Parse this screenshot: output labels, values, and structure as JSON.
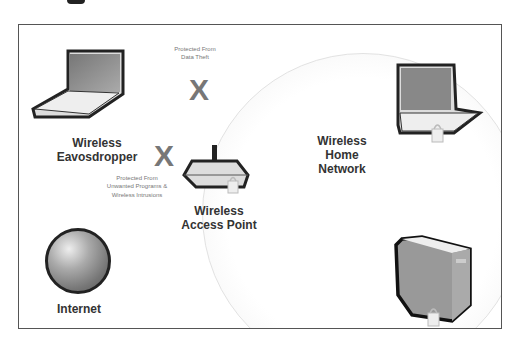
{
  "diagram": {
    "nodes": {
      "eavesdropper": {
        "label_line1": "Wireless",
        "label_line2": "Eavosdropper",
        "icon": "laptop-icon"
      },
      "access_point": {
        "label_line1": "Wireless",
        "label_line2": "Access Point",
        "icon": "router-icon"
      },
      "internet": {
        "label": "Internet",
        "icon": "globe-icon"
      },
      "home_network": {
        "label_line1": "Wireless",
        "label_line2": "Home",
        "label_line3": "Network"
      },
      "home_laptop": {
        "icon": "laptop-icon",
        "locked": true
      },
      "home_desktop": {
        "icon": "desktop-tower-icon",
        "locked": true
      }
    },
    "annotations": {
      "data_theft": {
        "line1": "Protected From",
        "line2": "Data Theft"
      },
      "intrusions": {
        "line1": "Protected From",
        "line2": "Unwanted Programs &",
        "line3": "Wireless Intrusions"
      }
    },
    "markers": {
      "blocked_symbol": "X"
    },
    "colors": {
      "frame": "#555555",
      "text": "#333333",
      "marker": "#777777",
      "circle": "#e6e6e6"
    }
  }
}
